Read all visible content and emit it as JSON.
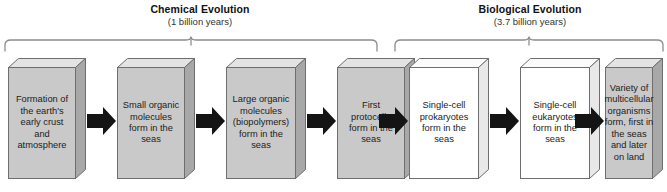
{
  "diagram": {
    "background_color": "#ffffff",
    "phases": [
      {
        "id": "chemical-evolution",
        "title": "Chemical Evolution",
        "duration": "(1 billion years)",
        "brace_label_center_x": 200,
        "box_fill": "#c9c9c9"
      },
      {
        "id": "biological-evolution",
        "title": "Biological Evolution",
        "duration": "(3.7 billion years)",
        "brace_label_center_x": 530,
        "box_fill": "#ffffff"
      }
    ],
    "steps": [
      {
        "id": "step-1",
        "phase": "chemical-evolution",
        "text": "Formation of the earth's early crust and atmosphere",
        "style": "gray"
      },
      {
        "id": "step-2",
        "phase": "chemical-evolution",
        "text": "Small organic molecules form in the seas",
        "style": "gray"
      },
      {
        "id": "step-3",
        "phase": "chemical-evolution",
        "text": "Large organic molecules (biopolymers) form in the seas",
        "style": "gray"
      },
      {
        "id": "step-4",
        "phase": "chemical-evolution",
        "text": "First protocells form in the seas",
        "style": "gray"
      },
      {
        "id": "step-5",
        "phase": "biological-evolution",
        "text": "Single-cell prokaryotes form in the seas",
        "style": "white"
      },
      {
        "id": "step-6",
        "phase": "biological-evolution",
        "text": "Single-cell eukaryotes form in the seas",
        "style": "white"
      },
      {
        "id": "step-7",
        "phase": "biological-evolution",
        "text": "Variety of multicellular organisms form, first in the seas and later on land",
        "style": "white"
      }
    ],
    "arrows": [
      {
        "id": "arrow-1",
        "from": "step-1",
        "to": "step-2",
        "direction": "right"
      },
      {
        "id": "arrow-2",
        "from": "step-2",
        "to": "step-3",
        "direction": "right"
      },
      {
        "id": "arrow-3",
        "from": "step-3",
        "to": "step-4",
        "direction": "right"
      },
      {
        "id": "arrow-4",
        "from": "step-4",
        "to": "step-5",
        "direction": "right"
      },
      {
        "id": "arrow-5",
        "from": "step-5",
        "to": "step-6",
        "direction": "right"
      },
      {
        "id": "arrow-6",
        "from": "step-6",
        "to": "step-7",
        "direction": "right"
      }
    ],
    "colors": {
      "chemical_box_fill": "#c9c9c9",
      "biological_box_fill": "#ffffff",
      "box_outline": "#6e6e6e",
      "box_top_face": "#e3e3e3",
      "box_side_face": "#a8a8a8",
      "arrow_fill": "#141414",
      "brace_stroke": "#8c8c8c",
      "text": "#1c1c1c"
    }
  }
}
